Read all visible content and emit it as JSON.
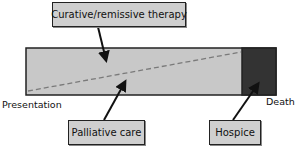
{
  "diagram": {
    "type": "care-timeline",
    "labels": {
      "curative": "Curative/remissive therapy",
      "palliative": "Palliative care",
      "hospice": "Hospice",
      "start": "Presentation",
      "end": "Death"
    },
    "timeline": {
      "start_label": "Presentation",
      "end_label": "Death",
      "segments": [
        {
          "name": "Curative/remissive therapy and palliative care",
          "color": "#c8c8c8"
        },
        {
          "name": "Hospice",
          "color": "#333333"
        }
      ],
      "divider": "dashed diagonal line separating curative (upper) from palliative (lower) proportion, rising from Presentation toward Death"
    },
    "colors": {
      "bar_fill": "#c8c8c8",
      "hospice_fill": "#333333",
      "box_fill": "#cfcfcf",
      "outline": "#222222",
      "dash": "#7a7a7a"
    }
  }
}
